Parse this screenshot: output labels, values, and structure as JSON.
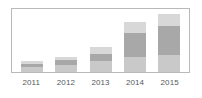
{
  "chart_data": {
    "type": "bar",
    "subtype": "stacked-bar",
    "title": "",
    "subtitle": "",
    "xlabel": "",
    "ylabel": "",
    "grid": false,
    "legend": "none",
    "axis_visible": {
      "x_tick_labels": true,
      "y_tick_labels": false,
      "plot_border": true
    },
    "ylim": [
      0,
      65
    ],
    "categories": [
      "2011",
      "2012",
      "2013",
      "2014",
      "2015"
    ],
    "series": [
      {
        "name": "segment-bottom",
        "color": "#c9c9c9",
        "values": [
          5,
          7,
          11,
          16,
          18
        ]
      },
      {
        "name": "segment-middle",
        "color": "#a8a8a8",
        "values": [
          3,
          5,
          8,
          24,
          29
        ]
      },
      {
        "name": "segment-top",
        "color": "#d8d8d8",
        "values": [
          3,
          4,
          7,
          12,
          13
        ]
      }
    ],
    "totals": [
      11,
      16,
      26,
      52,
      60
    ],
    "colors": {
      "bar_bottom": "#c9c9c9",
      "bar_middle": "#a8a8a8",
      "bar_top": "#d8d8d8",
      "plot_border": "#b9b9b9",
      "tick_label": "#55585c",
      "background": "#ffffff"
    }
  },
  "axis": {
    "ticks": [
      "2011",
      "2012",
      "2013",
      "2014",
      "2015"
    ]
  }
}
